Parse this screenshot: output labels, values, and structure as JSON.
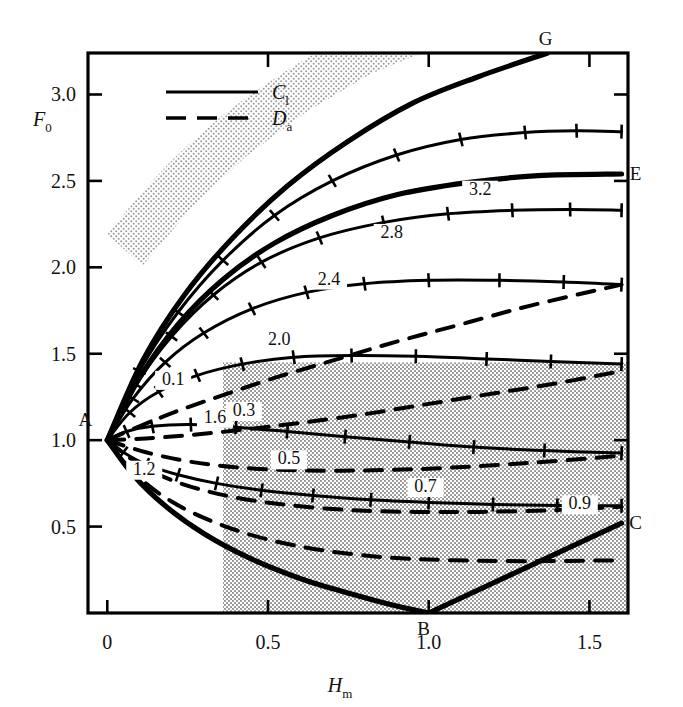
{
  "chart_data": {
    "type": "line",
    "title": "",
    "xlabel": "H_m",
    "ylabel": "F_0",
    "xlim": [
      -0.06,
      1.62
    ],
    "ylim": [
      0.0,
      3.24
    ],
    "grid": false,
    "legend_position": "top-left",
    "x_ticks": [
      {
        "value": 0,
        "label": "0"
      },
      {
        "value": 0.5,
        "label": "0.5"
      },
      {
        "value": 1.0,
        "label": "1.0"
      },
      {
        "value": 1.5,
        "label": "1.5"
      }
    ],
    "y_ticks": [
      {
        "value": 0.5,
        "label": "0.5"
      },
      {
        "value": 1.0,
        "label": "1.0"
      },
      {
        "value": 1.5,
        "label": "1.5"
      },
      {
        "value": 2.0,
        "label": "2.0"
      },
      {
        "value": 2.5,
        "label": "2.5"
      },
      {
        "value": 3.0,
        "label": "3.0"
      }
    ],
    "legend": [
      {
        "name": "C_l",
        "style": "solid",
        "label_main": "C",
        "label_sub": "l"
      },
      {
        "name": "D_a",
        "style": "dashed",
        "label_main": "D",
        "label_sub": "a"
      }
    ],
    "annotations": [
      {
        "text": "A",
        "x": 0.0,
        "y": 1.0,
        "dx": -22,
        "dy": -14
      },
      {
        "text": "B",
        "x": 1.0,
        "y": 0.0,
        "dx": -5,
        "dy": 22
      },
      {
        "text": "C",
        "x": 1.6,
        "y": 0.52,
        "dx": 14,
        "dy": 6
      },
      {
        "text": "E",
        "x": 1.6,
        "y": 2.54,
        "dx": 14,
        "dy": 6
      },
      {
        "text": "G",
        "x": 1.37,
        "y": 3.24,
        "dx": -2,
        "dy": -8
      }
    ],
    "series": [
      {
        "name": "C_l = 1.2",
        "style": "solid",
        "label": "1.2",
        "label_x": 0.115,
        "label_y": 0.8,
        "points": [
          [
            0,
            1.0
          ],
          [
            0.05,
            0.93
          ],
          [
            0.12,
            0.86
          ],
          [
            0.22,
            0.8
          ],
          [
            0.34,
            0.75
          ],
          [
            0.48,
            0.71
          ],
          [
            0.64,
            0.68
          ],
          [
            0.82,
            0.655
          ],
          [
            1.0,
            0.64
          ],
          [
            1.2,
            0.628
          ],
          [
            1.4,
            0.622
          ],
          [
            1.6,
            0.62
          ]
        ]
      },
      {
        "name": "C_l = 1.6",
        "style": "solid",
        "label": "1.6",
        "label_x": 0.335,
        "label_y": 1.1,
        "points": [
          [
            0,
            1.0
          ],
          [
            0.06,
            1.05
          ],
          [
            0.14,
            1.08
          ],
          [
            0.26,
            1.09
          ],
          [
            0.4,
            1.075
          ],
          [
            0.56,
            1.05
          ],
          [
            0.74,
            1.02
          ],
          [
            0.94,
            0.99
          ],
          [
            1.14,
            0.96
          ],
          [
            1.36,
            0.94
          ],
          [
            1.6,
            0.925
          ]
        ]
      },
      {
        "name": "C_l = 2.0",
        "style": "solid",
        "label": "2.0",
        "label_x": 0.535,
        "label_y": 1.55,
        "points": [
          [
            0,
            1.0
          ],
          [
            0.07,
            1.16
          ],
          [
            0.16,
            1.28
          ],
          [
            0.28,
            1.375
          ],
          [
            0.42,
            1.44
          ],
          [
            0.58,
            1.48
          ],
          [
            0.76,
            1.49
          ],
          [
            0.96,
            1.485
          ],
          [
            1.18,
            1.47
          ],
          [
            1.38,
            1.455
          ],
          [
            1.6,
            1.44
          ]
        ]
      },
      {
        "name": "C_l = 2.4",
        "style": "solid",
        "label": "2.4",
        "label_x": 0.69,
        "label_y": 1.9,
        "points": [
          [
            0,
            1.0
          ],
          [
            0.08,
            1.24
          ],
          [
            0.18,
            1.45
          ],
          [
            0.3,
            1.62
          ],
          [
            0.45,
            1.76
          ],
          [
            0.62,
            1.855
          ],
          [
            0.8,
            1.905
          ],
          [
            1.0,
            1.925
          ],
          [
            1.22,
            1.925
          ],
          [
            1.42,
            1.915
          ],
          [
            1.6,
            1.9
          ]
        ]
      },
      {
        "name": "C_l = 2.8",
        "style": "solid",
        "label": "2.8",
        "label_x": 0.885,
        "label_y": 2.17,
        "points": [
          [
            0,
            1.0
          ],
          [
            0.09,
            1.32
          ],
          [
            0.2,
            1.6
          ],
          [
            0.33,
            1.84
          ],
          [
            0.48,
            2.03
          ],
          [
            0.66,
            2.17
          ],
          [
            0.86,
            2.26
          ],
          [
            1.06,
            2.31
          ],
          [
            1.26,
            2.33
          ],
          [
            1.44,
            2.335
          ],
          [
            1.6,
            2.33
          ]
        ]
      },
      {
        "name": "C_l = 3.2",
        "style": "solid",
        "label": "3.2",
        "label_x": 1.16,
        "label_y": 2.42,
        "points": [
          [
            0,
            1.0
          ],
          [
            0.1,
            1.4
          ],
          [
            0.22,
            1.74
          ],
          [
            0.36,
            2.04
          ],
          [
            0.52,
            2.3
          ],
          [
            0.7,
            2.5
          ],
          [
            0.9,
            2.65
          ],
          [
            1.1,
            2.74
          ],
          [
            1.3,
            2.78
          ],
          [
            1.46,
            2.79
          ],
          [
            1.6,
            2.785
          ]
        ]
      },
      {
        "name": "D_a = 0.1",
        "style": "dashed",
        "label": "0.1",
        "label_x": 0.205,
        "label_y": 1.32,
        "points": [
          [
            0,
            1.0
          ],
          [
            0.1,
            1.08
          ],
          [
            0.22,
            1.17
          ],
          [
            0.36,
            1.26
          ],
          [
            0.52,
            1.36
          ],
          [
            0.7,
            1.46
          ],
          [
            0.9,
            1.57
          ],
          [
            1.1,
            1.67
          ],
          [
            1.32,
            1.78
          ],
          [
            1.6,
            1.9
          ]
        ]
      },
      {
        "name": "D_a = 0.3",
        "style": "dashed",
        "label": "0.3",
        "label_x": 0.425,
        "label_y": 1.14,
        "points": [
          [
            0,
            1.0
          ],
          [
            0.12,
            1.01
          ],
          [
            0.26,
            1.03
          ],
          [
            0.42,
            1.06
          ],
          [
            0.6,
            1.1
          ],
          [
            0.8,
            1.15
          ],
          [
            1.0,
            1.21
          ],
          [
            1.2,
            1.27
          ],
          [
            1.4,
            1.33
          ],
          [
            1.6,
            1.4
          ]
        ]
      },
      {
        "name": "D_a = 0.5",
        "style": "dashed",
        "label": "0.5",
        "label_x": 0.565,
        "label_y": 0.86,
        "points": [
          [
            0,
            1.0
          ],
          [
            0.12,
            0.93
          ],
          [
            0.26,
            0.875
          ],
          [
            0.42,
            0.84
          ],
          [
            0.6,
            0.825
          ],
          [
            0.8,
            0.825
          ],
          [
            1.0,
            0.835
          ],
          [
            1.2,
            0.855
          ],
          [
            1.4,
            0.88
          ],
          [
            1.6,
            0.91
          ]
        ]
      },
      {
        "name": "D_a = 0.7",
        "style": "dashed",
        "label": "0.7",
        "label_x": 0.99,
        "label_y": 0.7,
        "points": [
          [
            0,
            1.0
          ],
          [
            0.1,
            0.86
          ],
          [
            0.22,
            0.755
          ],
          [
            0.38,
            0.675
          ],
          [
            0.56,
            0.625
          ],
          [
            0.76,
            0.595
          ],
          [
            0.96,
            0.585
          ],
          [
            1.16,
            0.585
          ],
          [
            1.38,
            0.595
          ],
          [
            1.6,
            0.615
          ]
        ]
      },
      {
        "name": "D_a = 0.9",
        "style": "dashed",
        "label": "0.9",
        "label_x": 1.47,
        "label_y": 0.6,
        "points": [
          [
            0,
            1.0
          ],
          [
            0.09,
            0.8
          ],
          [
            0.2,
            0.645
          ],
          [
            0.34,
            0.52
          ],
          [
            0.5,
            0.425
          ],
          [
            0.68,
            0.36
          ],
          [
            0.88,
            0.32
          ],
          [
            1.08,
            0.305
          ],
          [
            1.3,
            0.3
          ],
          [
            1.6,
            0.305
          ]
        ]
      },
      {
        "name": "boundary AG",
        "style": "boundary",
        "label": "",
        "points": [
          [
            0,
            1.0
          ],
          [
            0.11,
            1.46
          ],
          [
            0.24,
            1.84
          ],
          [
            0.39,
            2.17
          ],
          [
            0.56,
            2.47
          ],
          [
            0.75,
            2.73
          ],
          [
            0.95,
            2.95
          ],
          [
            1.15,
            3.1
          ],
          [
            1.37,
            3.24
          ]
        ]
      },
      {
        "name": "boundary AE",
        "style": "boundary",
        "label": "",
        "points": [
          [
            0,
            1.0
          ],
          [
            0.1,
            1.36
          ],
          [
            0.22,
            1.67
          ],
          [
            0.36,
            1.93
          ],
          [
            0.52,
            2.14
          ],
          [
            0.7,
            2.3
          ],
          [
            0.9,
            2.42
          ],
          [
            1.12,
            2.49
          ],
          [
            1.34,
            2.53
          ],
          [
            1.6,
            2.54
          ]
        ]
      },
      {
        "name": "boundary AB",
        "style": "boundary",
        "label": "",
        "points": [
          [
            0,
            1.0
          ],
          [
            0.08,
            0.8
          ],
          [
            0.18,
            0.62
          ],
          [
            0.3,
            0.46
          ],
          [
            0.44,
            0.32
          ],
          [
            0.6,
            0.2
          ],
          [
            0.76,
            0.11
          ],
          [
            0.9,
            0.04
          ],
          [
            1.0,
            0.0
          ]
        ]
      },
      {
        "name": "boundary BC",
        "style": "boundary",
        "label": "",
        "points": [
          [
            1.0,
            0.0
          ],
          [
            1.6,
            0.52
          ]
        ]
      }
    ],
    "shaded_regions": [
      {
        "name": "upper-diagonal-band",
        "kind": "band",
        "shade": "#b9b9b9"
      },
      {
        "name": "lower-rectangle",
        "kind": "rect",
        "shade": "#c3c3c3",
        "x0": 0.36,
        "x1": 1.62,
        "y0": 0.0,
        "y1": 1.45
      }
    ]
  }
}
